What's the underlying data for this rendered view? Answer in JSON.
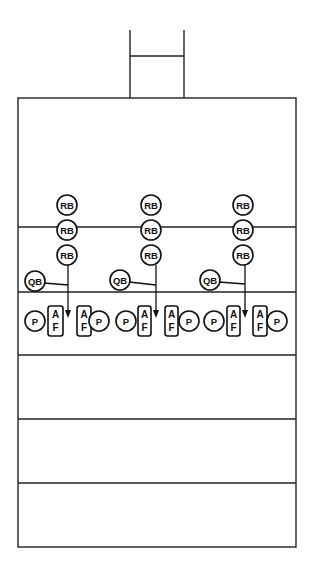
{
  "diagram": {
    "type": "football-play-diagram",
    "colors": {
      "line": "#222222",
      "background": "#ffffff"
    },
    "goalpost": {
      "left_x": 130,
      "right_x": 184,
      "top_y": 30,
      "crossbar_y": 56,
      "base_y": 98
    },
    "field": {
      "left": 18,
      "right": 296,
      "top": 98,
      "bottom": 547,
      "yard_lines": [
        227,
        292,
        355,
        419,
        483
      ]
    },
    "labels": {
      "running_back": "RB",
      "quarterback": "QB",
      "player": "P",
      "af_top": "A",
      "af_bottom": "F"
    },
    "groups": [
      {
        "name": "left",
        "rb": [
          {
            "x": 67,
            "y": 205
          },
          {
            "x": 67,
            "y": 230
          },
          {
            "x": 67,
            "y": 255
          }
        ],
        "qb": {
          "x": 35,
          "y": 281
        },
        "p_left": {
          "x": 35,
          "y": 321
        },
        "af_left": {
          "x": 48,
          "y": 306,
          "w": 15,
          "h": 30
        },
        "arrow": {
          "x": 68,
          "y_start": 265,
          "y_end": 318,
          "qb_link_y": 285
        },
        "af_right": {
          "x": 77,
          "y": 306,
          "w": 14,
          "h": 30
        },
        "p_right": {
          "x": 99,
          "y": 321
        }
      },
      {
        "name": "middle",
        "rb": [
          {
            "x": 151,
            "y": 205
          },
          {
            "x": 151,
            "y": 230
          },
          {
            "x": 151,
            "y": 255
          }
        ],
        "qb": {
          "x": 120,
          "y": 280
        },
        "p_left": {
          "x": 126,
          "y": 321
        },
        "af_left": {
          "x": 138,
          "y": 306,
          "w": 13,
          "h": 30
        },
        "arrow": {
          "x": 156,
          "y_start": 265,
          "y_end": 318,
          "qb_link_y": 285
        },
        "af_right": {
          "x": 165,
          "y": 306,
          "w": 13,
          "h": 30
        },
        "p_right": {
          "x": 189,
          "y": 321
        }
      },
      {
        "name": "right",
        "rb": [
          {
            "x": 243,
            "y": 205
          },
          {
            "x": 243,
            "y": 230
          },
          {
            "x": 243,
            "y": 255
          }
        ],
        "qb": {
          "x": 210,
          "y": 280
        },
        "p_left": {
          "x": 214,
          "y": 321
        },
        "af_left": {
          "x": 227,
          "y": 306,
          "w": 13,
          "h": 30
        },
        "arrow": {
          "x": 245,
          "y_start": 265,
          "y_end": 318,
          "qb_link_y": 284
        },
        "af_right": {
          "x": 253,
          "y": 306,
          "w": 14,
          "h": 30
        },
        "p_right": {
          "x": 277,
          "y": 321
        }
      }
    ]
  }
}
